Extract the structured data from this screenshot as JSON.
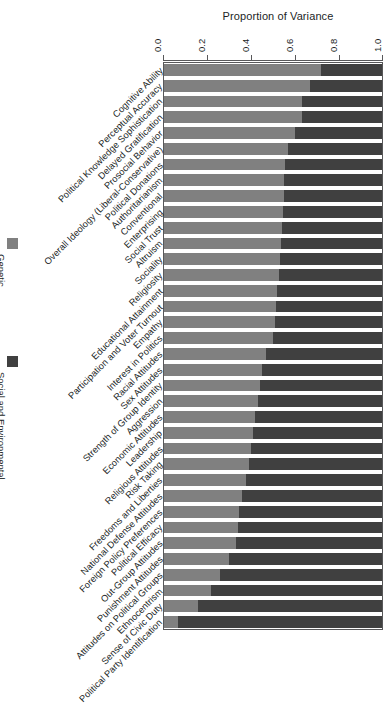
{
  "chart_data": {
    "type": "bar",
    "subtype": "stacked-horizontal",
    "title": "Proportion of Variance",
    "xlabel": "Proportion of Variance",
    "ylabel": "",
    "xlim": [
      0.0,
      1.0
    ],
    "xticks": [
      0.0,
      0.2,
      0.4,
      0.6,
      0.8,
      1.0
    ],
    "xtick_labels": [
      "0.0",
      "0.2",
      "0.4",
      "0.6",
      "0.8",
      "1.0"
    ],
    "grid": false,
    "legend_position": "left",
    "label_rotation_deg": -45,
    "tick_label_rotation_deg": -90,
    "categories": [
      "Cognitive Ability",
      "Perceptual Accuracy",
      "Political Knowledge Sophistication",
      "Delayed Gratification",
      "Prosocial Behavior",
      "Overall Ideology (Liberal-Conservative)",
      "Political Donations",
      "Authoritarianism",
      "Conventional",
      "Enterprising",
      "Social Trust",
      "Altruism",
      "Sociality",
      "Religiosity",
      "Educational Attainment",
      "Participation and Voter Turnout",
      "Empathy",
      "Interest in Politics",
      "Racial Attitudes",
      "Sex Attitudes",
      "Strength of Group Identity",
      "Aggression",
      "Economic Attitudes",
      "Leadership",
      "Religious Attitudes",
      "Risk Taking",
      "Freedoms and Liberties",
      "National Defense Attitudes",
      "Foreign Policy Preferences",
      "Political Efficacy",
      "Out-Group Attitudes",
      "Punishment Attitudes",
      "Attitudes on Political Groups",
      "Ethnocentrism",
      "Sense of Civic Duty",
      "Political Party Identification"
    ],
    "series": [
      {
        "name": "Genetic",
        "color": "#808080",
        "values": [
          0.72,
          0.67,
          0.63,
          0.63,
          0.6,
          0.57,
          0.555,
          0.55,
          0.55,
          0.545,
          0.54,
          0.535,
          0.53,
          0.525,
          0.52,
          0.515,
          0.51,
          0.5,
          0.47,
          0.45,
          0.44,
          0.43,
          0.42,
          0.41,
          0.4,
          0.39,
          0.375,
          0.36,
          0.345,
          0.34,
          0.33,
          0.3,
          0.26,
          0.22,
          0.16,
          0.07
        ]
      },
      {
        "name": "Social and Environmental",
        "color": "#404040",
        "values": [
          0.28,
          0.33,
          0.37,
          0.37,
          0.4,
          0.43,
          0.445,
          0.45,
          0.45,
          0.455,
          0.46,
          0.465,
          0.47,
          0.475,
          0.48,
          0.485,
          0.49,
          0.5,
          0.53,
          0.55,
          0.56,
          0.57,
          0.58,
          0.59,
          0.6,
          0.61,
          0.625,
          0.64,
          0.655,
          0.66,
          0.67,
          0.7,
          0.74,
          0.78,
          0.84,
          0.93
        ]
      }
    ],
    "legend_entries": [
      {
        "label": "Genetic",
        "color": "#808080"
      },
      {
        "label": "Social and Environmental",
        "color": "#404040"
      }
    ]
  }
}
